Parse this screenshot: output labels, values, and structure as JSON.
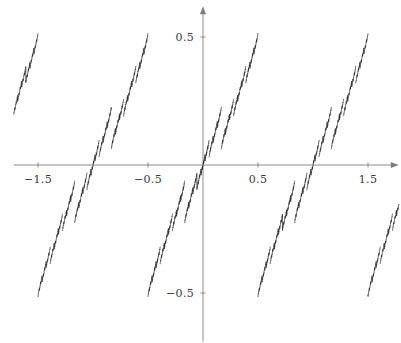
{
  "figure": {
    "title": "",
    "width": 401,
    "height": 343,
    "background": "#ffffff",
    "axis_color": "#808080",
    "curve_color": "#1a1a1a",
    "tick_label_color": "#3a3a3a"
  },
  "axes": {
    "origin_px": {
      "x": 203,
      "y": 165
    },
    "x_unit_px": 110,
    "y_unit_px": 256,
    "x_axis": {
      "label": "",
      "arrow": true,
      "range": [
        -1.72,
        1.78
      ],
      "tick_values": [
        -1.5,
        -0.5,
        0.5,
        1.5
      ],
      "tick_labels": [
        "−1.5",
        "−0.5",
        "0.5",
        "1.5"
      ]
    },
    "y_axis": {
      "label": "",
      "arrow": true,
      "range": [
        -0.69,
        0.62
      ],
      "tick_values": [
        0.5,
        -0.5
      ],
      "tick_labels": [
        "0.5",
        "−0.5"
      ]
    }
  },
  "chart_data": {
    "type": "line",
    "title": "",
    "xlabel": "",
    "ylabel": "",
    "xlim": [
      -1.72,
      1.78
    ],
    "ylim": [
      -0.69,
      0.62
    ],
    "grid": false,
    "legend": null,
    "series": [
      {
        "name": "fractal-staircase",
        "color": "#1a1a1a",
        "line_width": 0.7,
        "generator": {
          "kind": "lacunary-sawtooth-sum",
          "base_slope": 0.62,
          "harmonics": [
            {
              "period": 1.0,
              "amplitude": 0.245
            },
            {
              "period": 0.333333,
              "amplitude": 0.098
            },
            {
              "period": 0.111111,
              "amplitude": 0.04
            },
            {
              "period": 0.037037,
              "amplitude": 0.0162
            },
            {
              "period": 0.012346,
              "amplitude": 0.0066
            },
            {
              "period": 0.004115,
              "amplitude": 0.0027
            },
            {
              "period": 0.001372,
              "amplitude": 0.0011
            }
          ],
          "samples": 9000,
          "note": "y(x) = sum_k a_k * s((x + 0.5*p_k)/p_k), where s is the centered sawtooth on [-0.5,0.5]; curve is clipped to the plot box."
        },
        "sample_points": [
          {
            "x": -1.7,
            "y": -0.62
          },
          {
            "x": -1.5,
            "y": -0.46
          },
          {
            "x": -1.3,
            "y": -0.33
          },
          {
            "x": -1.22,
            "y": -0.2
          },
          {
            "x": -1.15,
            "y": -0.28
          },
          {
            "x": -1.05,
            "y": -0.16
          },
          {
            "x": -1.0,
            "y": -0.6
          },
          {
            "x": -0.8,
            "y": 0.22
          },
          {
            "x": -0.72,
            "y": 0.33
          },
          {
            "x": -0.7,
            "y": 0.06
          },
          {
            "x": -0.66,
            "y": 0.18
          },
          {
            "x": -0.6,
            "y": 0.28
          },
          {
            "x": -0.52,
            "y": 0.41
          },
          {
            "x": -0.5,
            "y": 0.17
          },
          {
            "x": -0.3,
            "y": 0.4
          },
          {
            "x": -0.22,
            "y": 0.53
          },
          {
            "x": -0.1,
            "y": 0.25
          },
          {
            "x": -0.02,
            "y": 0.03
          },
          {
            "x": 0.0,
            "y": 0.0
          },
          {
            "x": 0.02,
            "y": -0.03
          },
          {
            "x": 0.1,
            "y": 0.13
          },
          {
            "x": 0.18,
            "y": 0.28
          },
          {
            "x": 0.25,
            "y": 0.12
          },
          {
            "x": 0.33,
            "y": 0.28
          },
          {
            "x": 0.42,
            "y": 0.45
          },
          {
            "x": 0.5,
            "y": 0.58
          },
          {
            "x": 0.52,
            "y": -0.32
          },
          {
            "x": 0.7,
            "y": -0.22
          },
          {
            "x": 0.78,
            "y": -0.1
          },
          {
            "x": 0.9,
            "y": -0.3
          },
          {
            "x": 1.0,
            "y": -0.12
          },
          {
            "x": 1.08,
            "y": 0.0
          },
          {
            "x": 1.2,
            "y": 0.14
          },
          {
            "x": 1.28,
            "y": 0.27
          },
          {
            "x": 1.4,
            "y": 0.38
          },
          {
            "x": 1.5,
            "y": 0.5
          },
          {
            "x": 1.62,
            "y": 0.58
          }
        ]
      }
    ]
  }
}
